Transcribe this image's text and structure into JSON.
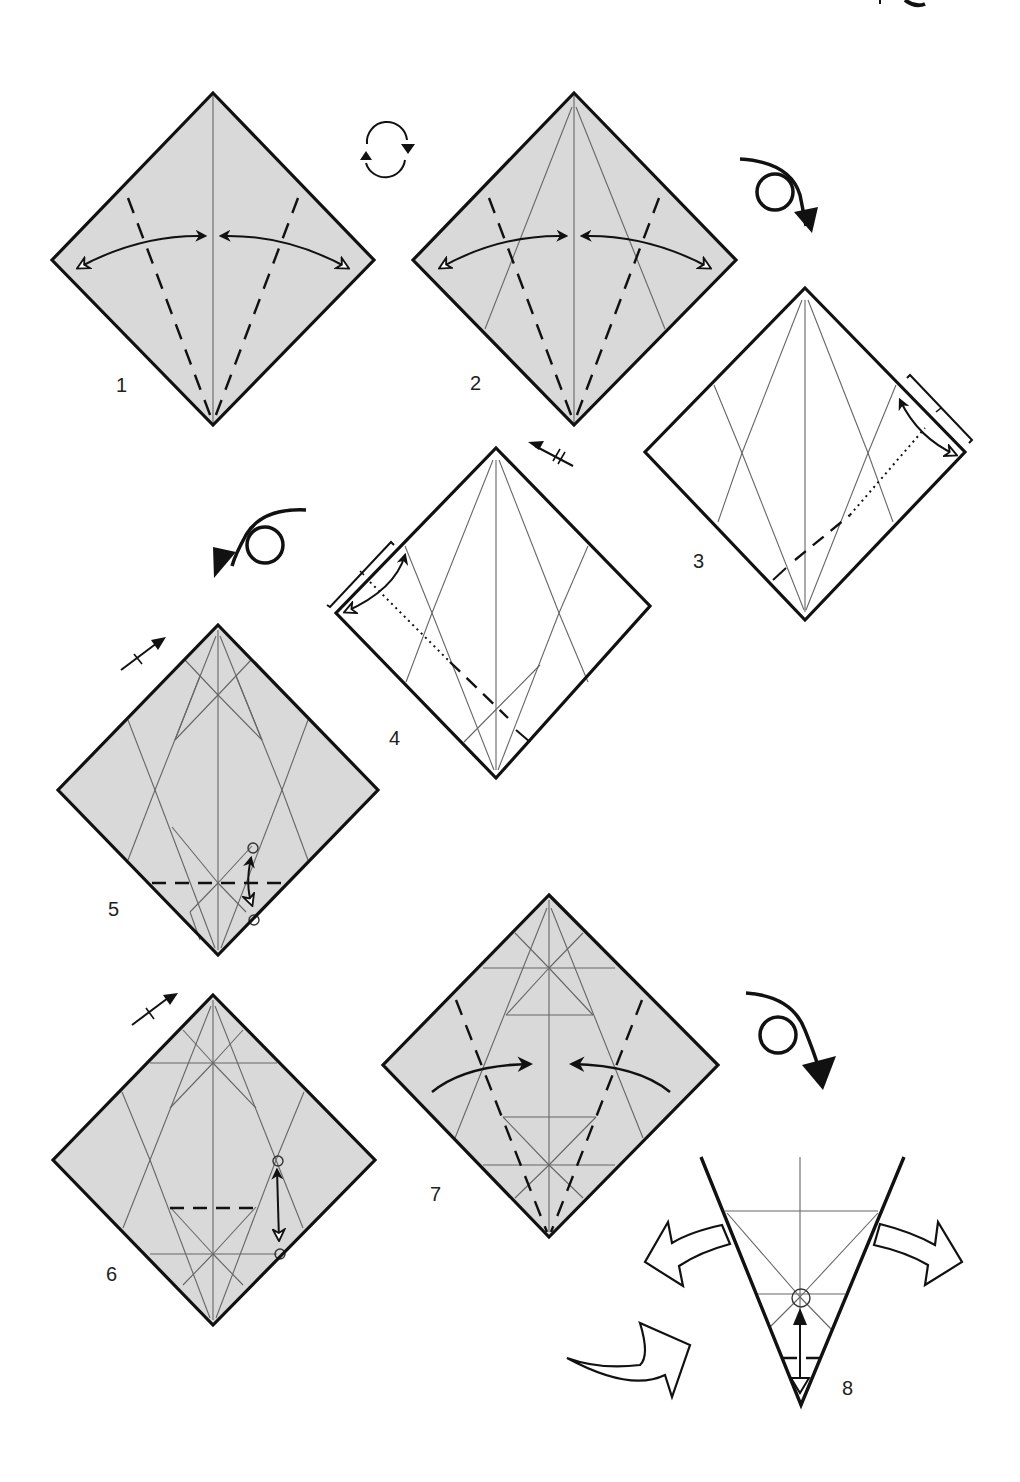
{
  "diagram": {
    "type": "origami-instructions",
    "background_color": "#ffffff",
    "paper_color_colored_side": "#d9d9d9",
    "paper_color_white_side": "#ffffff",
    "line_color": "#111111",
    "crease_color": "#666666",
    "steps": [
      {
        "number": "1",
        "label": "1",
        "paper_side": "colored",
        "action": "valley-fold edges to center crease and unfold",
        "symbols": [
          "valley-fold-lines",
          "fold-and-unfold-arrows"
        ]
      },
      {
        "number": "2",
        "label": "2",
        "paper_side": "colored",
        "action": "valley-fold edges to center crease and unfold",
        "symbols": [
          "valley-fold-lines",
          "fold-and-unfold-arrows"
        ]
      },
      {
        "number": "3",
        "label": "3",
        "paper_side": "white",
        "action": "fold and unfold along marked length",
        "symbols": [
          "valley-fold-line",
          "x-ray-line",
          "fold-and-unfold-arrow",
          "length-bracket"
        ]
      },
      {
        "number": "4",
        "label": "4",
        "paper_side": "white",
        "action": "repeat behind / fold and unfold",
        "symbols": [
          "valley-fold-line",
          "x-ray-line",
          "fold-and-unfold-arrow",
          "length-bracket",
          "repeat-arrow"
        ]
      },
      {
        "number": "5",
        "label": "5",
        "paper_side": "colored",
        "action": "valley-fold point to reference circle and unfold",
        "symbols": [
          "valley-fold-line",
          "reference-circles",
          "fold-and-unfold-arrow",
          "repeat-arrow"
        ]
      },
      {
        "number": "6",
        "label": "6",
        "paper_side": "colored",
        "action": "valley-fold between reference points and unfold",
        "symbols": [
          "valley-fold-line",
          "reference-circles",
          "fold-and-unfold-arrow",
          "repeat-arrow"
        ]
      },
      {
        "number": "7",
        "label": "7",
        "paper_side": "colored",
        "action": "valley-fold edges to center",
        "symbols": [
          "valley-fold-lines",
          "fold-arrows"
        ]
      },
      {
        "number": "8",
        "label": "8",
        "paper_side": "white",
        "action": "fold tip up to reference circle, open flaps outward",
        "symbols": [
          "valley-fold-line",
          "reference-circle",
          "fold-and-unfold-arrow",
          "open-arrows",
          "sink-arrow"
        ]
      }
    ],
    "transition_symbols": [
      {
        "between": "1-2",
        "symbol": "rotate-icon"
      },
      {
        "between": "2-3",
        "symbol": "turn-over-icon"
      },
      {
        "between": "4-5",
        "symbol": "turn-over-icon"
      },
      {
        "between": "7-8",
        "symbol": "turn-over-icon"
      }
    ]
  }
}
